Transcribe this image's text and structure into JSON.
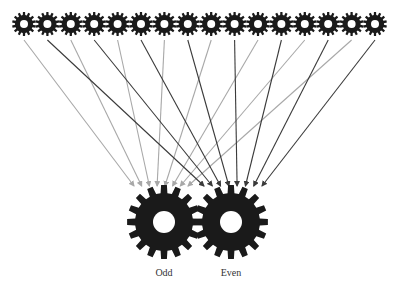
{
  "diagram": {
    "type": "gear-distribution",
    "colors": {
      "gear": "#1a1a1a",
      "odd_arrow": "#a8a8a8",
      "even_arrow": "#3a3a3a",
      "background": "#ffffff"
    },
    "top_gears": {
      "count": 16,
      "start_x": 24,
      "spacing": 23.4,
      "y": 24,
      "outer_r": 12,
      "inner_r": 9,
      "hole_r": 4,
      "teeth": 14
    },
    "bottom_gears": [
      {
        "id": "odd",
        "label": "Odd",
        "cx": 164,
        "cy": 222,
        "outer_r": 37,
        "inner_r": 29,
        "hole_r": 11,
        "teeth": 16,
        "label_y": 267,
        "arrow_target_x0": 134,
        "arrow_target_x1": 188
      },
      {
        "id": "even",
        "label": "Even",
        "cx": 231,
        "cy": 222,
        "outer_r": 37,
        "inner_r": 29,
        "hole_r": 11,
        "teeth": 16,
        "label_y": 267,
        "arrow_target_x0": 204,
        "arrow_target_x1": 262
      }
    ],
    "arrows": {
      "start_y": 40,
      "end_y": 186
    }
  }
}
